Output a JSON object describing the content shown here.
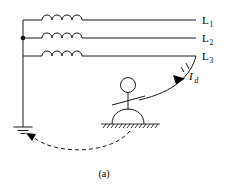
{
  "figure": {
    "caption": "(a)"
  },
  "phase_lines": [
    {
      "label": "L",
      "subscript": "1",
      "name": "line-l1"
    },
    {
      "label": "L",
      "subscript": "2",
      "name": "line-l2"
    },
    {
      "label": "L",
      "subscript": "3",
      "name": "line-l3"
    }
  ],
  "current": {
    "symbol": "I",
    "subscript": "d",
    "name": "fault-current-Id"
  },
  "components": {
    "inductor_count": 3,
    "coil_loops_per_inductor": 4,
    "junction_dot_on": "L2",
    "earth_ground_bars": 3,
    "hatched_ground": "standing-surface",
    "return_path": "dashed-arc-from-standing-ground-to-earth-ground"
  },
  "colors": {
    "stroke": "#1a1a1a",
    "background": "#ffffff",
    "arrow": "#000000"
  }
}
